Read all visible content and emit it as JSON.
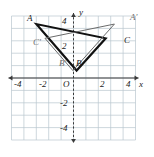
{
  "figure": {
    "name": "coordinate-plane-reflection",
    "grid": {
      "x_min": -5,
      "x_max": 5,
      "y_min": -5,
      "y_max": 5,
      "unit_px": 12.4,
      "origin_px": [
        73.5,
        78
      ],
      "grid_color": "#b9c6cf",
      "axis_color": "#3a3a3a",
      "show_grid": true
    },
    "axes": {
      "x_label": "x",
      "y_label": "y",
      "x_ticks": [
        "-4",
        "-2",
        "2",
        "4"
      ],
      "y_ticks": [
        "4",
        "2",
        "-2",
        "-4"
      ],
      "origin_label": "O"
    },
    "triangles": [
      {
        "name": "triangle-ABC",
        "style": "bold",
        "color": "#111111",
        "stroke_width": 2.1,
        "vertices": [
          {
            "label": "A",
            "x": -3.0,
            "y": 4.35
          },
          {
            "label": "B",
            "x": 0.25,
            "y": 0.6
          },
          {
            "label": "C",
            "x": 2.6,
            "y": 3.2
          }
        ]
      },
      {
        "name": "triangle-A-prime-B-prime-C-prime",
        "style": "thin",
        "color": "#6b6b6b",
        "stroke_width": 1.0,
        "vertices": [
          {
            "label": "A'",
            "x": 3.3,
            "y": 4.35
          },
          {
            "label": "B'",
            "x": -0.05,
            "y": 0.6
          },
          {
            "label": "C'",
            "x": -2.3,
            "y": 3.2
          }
        ]
      }
    ],
    "vertex_labels": [
      {
        "text": "A",
        "x": 27,
        "y": 14,
        "tone": "dark"
      },
      {
        "text": "C'",
        "x": 33,
        "y": 38,
        "tone": "light"
      },
      {
        "text": "B'",
        "x": 59,
        "y": 59,
        "tone": "light"
      },
      {
        "text": "B",
        "x": 76,
        "y": 59,
        "tone": "dark"
      },
      {
        "text": "C",
        "x": 124,
        "y": 36,
        "tone": "dark"
      },
      {
        "text": "A'",
        "x": 130,
        "y": 13,
        "tone": "light"
      }
    ],
    "tick_labels": [
      {
        "text": "-4",
        "x": 14,
        "y": 80
      },
      {
        "text": "-2",
        "x": 39,
        "y": 80
      },
      {
        "text": "O",
        "x": 63,
        "y": 80
      },
      {
        "text": "2",
        "x": 100,
        "y": 80
      },
      {
        "text": "4",
        "x": 126,
        "y": 80
      },
      {
        "text": "4",
        "x": 62,
        "y": 17
      },
      {
        "text": "2",
        "x": 62,
        "y": 42
      },
      {
        "text": "-2",
        "x": 60,
        "y": 99
      },
      {
        "text": "-4",
        "x": 60,
        "y": 124
      }
    ],
    "axis_name_labels": [
      {
        "text": "y",
        "x": 79,
        "y": 8
      },
      {
        "text": "x",
        "x": 139,
        "y": 80
      }
    ]
  }
}
